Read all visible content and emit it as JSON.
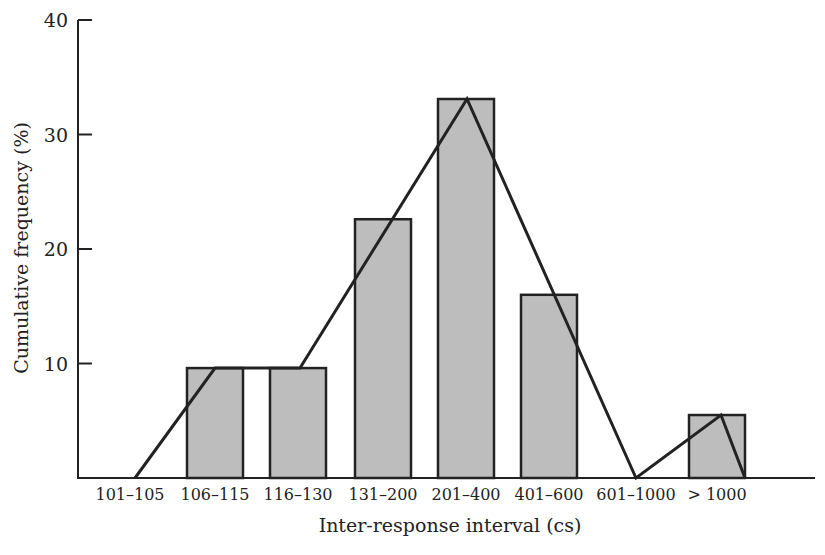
{
  "chart_data": {
    "type": "bar",
    "title": "",
    "xlabel": "Inter-response interval (cs)",
    "ylabel": "Cumulative frequency (%)",
    "ylim": [
      0,
      40
    ],
    "yticks": [
      10,
      20,
      30,
      40
    ],
    "grid": false,
    "legend": null,
    "categories": [
      "101–105",
      "106–115",
      "116–130",
      "131–200",
      "201–400",
      "401–600",
      "601–1000",
      "> 1000"
    ],
    "values": [
      0,
      9.6,
      9.6,
      22.6,
      33.1,
      16.0,
      0,
      5.5
    ],
    "overlay_line": {
      "type": "line",
      "description": "frequency polygon connecting bar tops",
      "points": [
        {
          "category": "101–105",
          "value": 0
        },
        {
          "category": "106–115",
          "value": 9.6
        },
        {
          "category": "116–130",
          "value": 9.6
        },
        {
          "category": "201–400",
          "value": 33.1
        },
        {
          "category": "601–1000",
          "value": 0
        },
        {
          "category": "> 1000",
          "value": 5.5
        },
        {
          "category": "> 1000 (end)",
          "value": 0
        }
      ]
    },
    "colors": {
      "bar_fill": "#bdbdbd",
      "stroke": "#222222"
    }
  }
}
